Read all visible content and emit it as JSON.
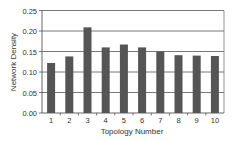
{
  "chart_data": {
    "type": "bar",
    "title": "",
    "xlabel": "Topology Number",
    "ylabel": "Network Density",
    "categories": [
      "1",
      "2",
      "3",
      "4",
      "5",
      "6",
      "7",
      "8",
      "9",
      "10"
    ],
    "values": [
      0.122,
      0.138,
      0.209,
      0.16,
      0.167,
      0.16,
      0.15,
      0.141,
      0.14,
      0.139
    ],
    "ylim": [
      0,
      0.25
    ],
    "yticks": [
      "0.00",
      "0.05",
      "0.10",
      "0.15",
      "0.20",
      "0.25"
    ],
    "grid": true,
    "legend": null,
    "bar_color": "#555555",
    "grid_color": "#555555"
  }
}
